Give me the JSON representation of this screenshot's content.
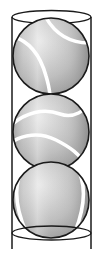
{
  "figure": {
    "title": "Three tennis balls stacked inside a cylindrical can",
    "caption": "Three tennis balls stacked inside a cylindrical can",
    "background_color": "#ffffff",
    "outline_color": "#1a1a1a",
    "ball_count": 3
  },
  "cylinder": {
    "name": "can",
    "left_x": 12,
    "right_x": 91,
    "top_y": 17,
    "bottom_y": 233,
    "wall_extension_below": 16,
    "ellipse_rx": 39.5,
    "ellipse_ry": 6.5,
    "stroke_color": "#1a1a1a",
    "stroke_width": 1.3,
    "fill": "none",
    "top_rim_label": "can-top-rim",
    "bottom_rim_label": "can-bottom-rim",
    "left_wall_label": "can-left-wall",
    "right_wall_label": "can-right-wall"
  },
  "balls": [
    {
      "id": "ball-top",
      "label": "Top tennis ball",
      "cx": 51,
      "cy": 56,
      "r": 38,
      "seam_style": "diagonal",
      "fill_light": "#e0e0e0",
      "fill_mid": "#bdbdbd",
      "fill_dark": "#8f8f8f",
      "seam_color": "#ffffff",
      "outline_color": "#1a1a1a"
    },
    {
      "id": "ball-middle",
      "label": "Middle tennis ball",
      "cx": 51,
      "cy": 132,
      "r": 38,
      "seam_style": "horizontal",
      "fill_light": "#e0e0e0",
      "fill_mid": "#bdbdbd",
      "fill_dark": "#8f8f8f",
      "seam_color": "#ffffff",
      "outline_color": "#1a1a1a"
    },
    {
      "id": "ball-bottom",
      "label": "Bottom tennis ball",
      "cx": 51,
      "cy": 200,
      "r": 38,
      "seam_style": "vertical",
      "fill_light": "#e0e0e0",
      "fill_mid": "#bdbdbd",
      "fill_dark": "#8f8f8f",
      "seam_color": "#ffffff",
      "outline_color": "#1a1a1a"
    }
  ]
}
